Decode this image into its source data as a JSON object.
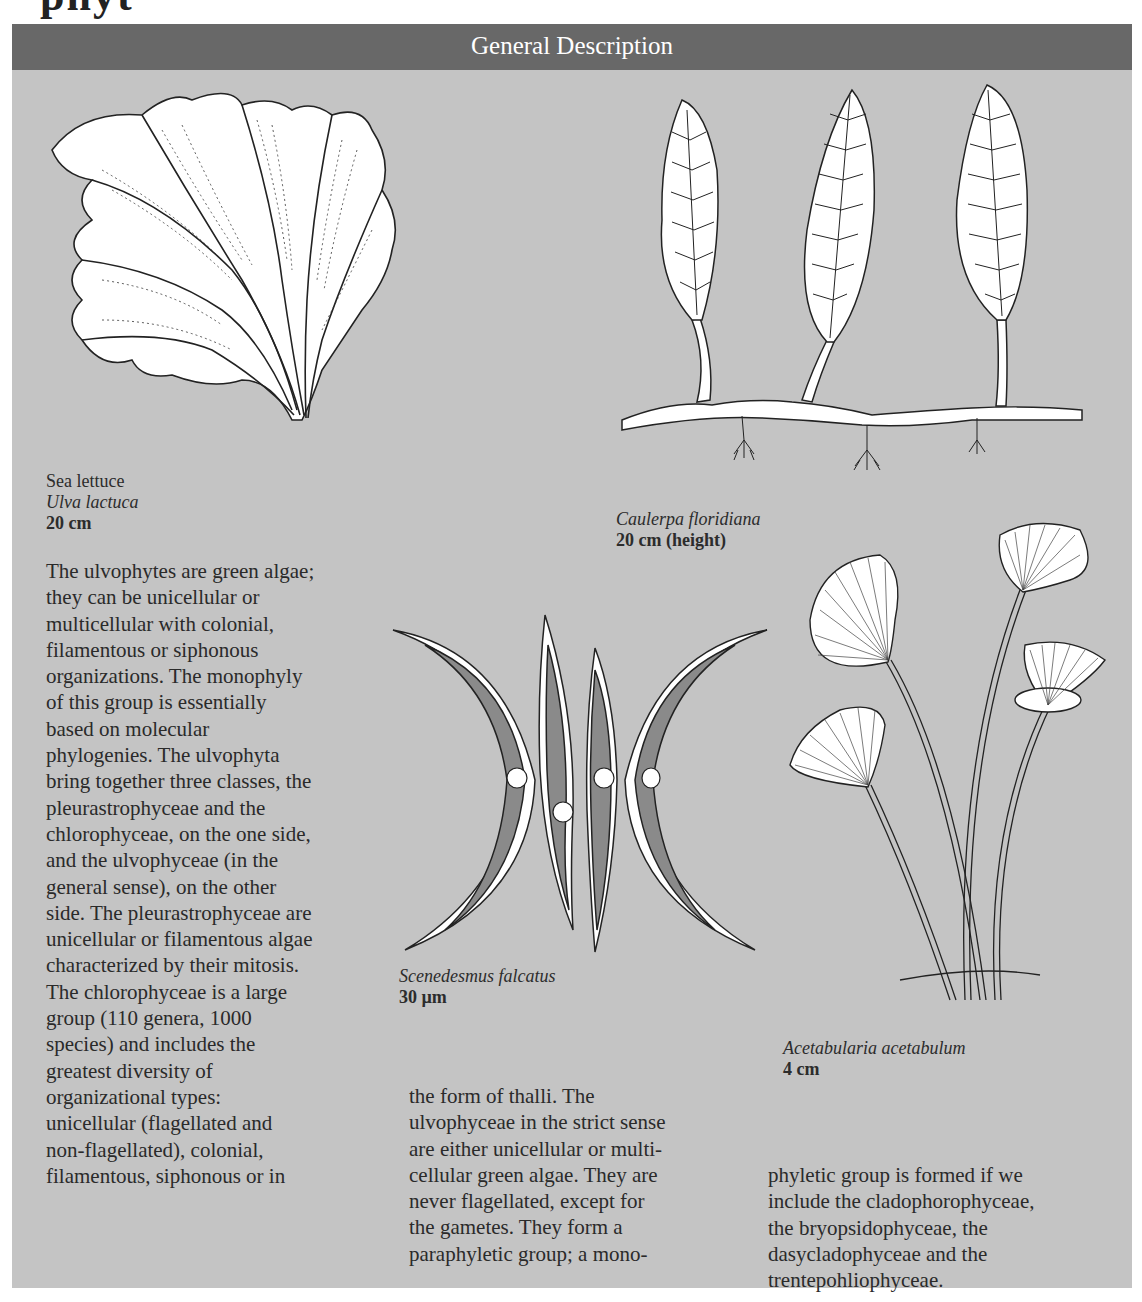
{
  "page": {
    "title_fragment": "phyt",
    "section_header": "General Description"
  },
  "figures": [
    {
      "id": "sea-lettuce",
      "common_name": "Sea lettuce",
      "scientific_name": "Ulva lactuca",
      "size": "20 cm"
    },
    {
      "id": "caulerpa",
      "scientific_name": "Caulerpa floridiana",
      "size": "20 cm (height)"
    },
    {
      "id": "scenedesmus",
      "scientific_name": "Scenedesmus falcatus",
      "size": "30 µm"
    },
    {
      "id": "acetabularia",
      "scientific_name": "Acetabularia acetabulum",
      "size": "4 cm"
    }
  ],
  "body": {
    "col1": [
      "The ulvophytes are green algae;",
      "they can be unicellular or",
      "multicellular with colonial,",
      "filamentous or siphonous",
      "organizations. The monophyly",
      "of this group is essentially",
      "based on molecular",
      "phylogenies. The ulvophyta",
      "bring together three classes, the",
      "pleurastrophyceae and the",
      "chlorophyceae, on the one side,",
      "and the ulvophyceae (in the",
      "general sense), on the other",
      "side. The pleurastrophyceae are",
      "unicellular or filamentous algae",
      "characterized by their mitosis.",
      "The chlorophyceae is a large",
      "group (110 genera, 1000",
      "species) and includes the",
      "greatest diversity of",
      "organizational types:",
      "unicellular (flagellated and",
      "non-flagellated), colonial,",
      "filamentous, siphonous or in"
    ],
    "col2": [
      "the form of thalli. The",
      "ulvophyceae in the strict sense",
      "are either unicellular or multi-",
      "cellular green algae. They are",
      "never flagellated, except for",
      "the gametes. They form a",
      "paraphyletic group; a mono-"
    ],
    "col3": [
      "phyletic group is formed if we",
      "include the cladophorophyceae,",
      "the bryopsidophyceae, the",
      "dasycladophyceae and the",
      "trentepohliophyceae."
    ]
  }
}
